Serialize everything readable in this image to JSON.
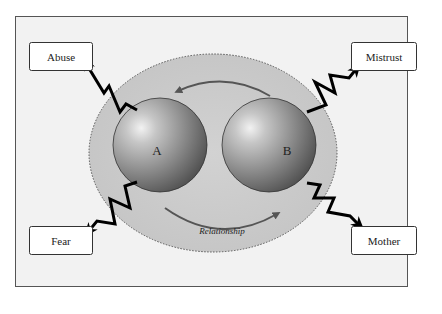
{
  "diagram": {
    "circles": [
      {
        "id": "A",
        "label": "A"
      },
      {
        "id": "B",
        "label": "B"
      }
    ],
    "relationship_label": "Relationship",
    "boxes": [
      {
        "id": "abuse",
        "label": "Abuse",
        "position": "top-left"
      },
      {
        "id": "mistrust",
        "label": "Mistrust",
        "position": "top-right"
      },
      {
        "id": "fear",
        "label": "Fear",
        "position": "bottom-left"
      },
      {
        "id": "mother",
        "label": "Mother",
        "position": "bottom-right"
      }
    ],
    "colors": {
      "background": "#f2f2f2",
      "ellipse_fill": "#c8c8c8",
      "sphere_light": "#e6e6e6",
      "sphere_dark": "#5a5a5a",
      "arrow": "#555555",
      "bolt": "#000000",
      "border": "#555555"
    }
  }
}
